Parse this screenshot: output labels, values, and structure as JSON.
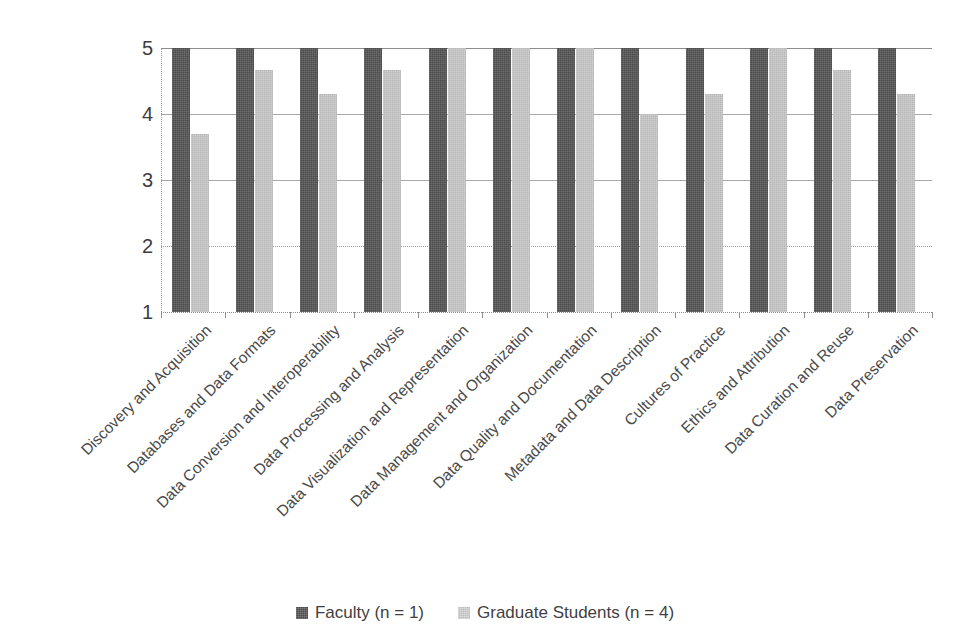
{
  "chart_data": {
    "type": "bar",
    "title": "",
    "subtitle": "",
    "xlabel": "",
    "ylabel": "",
    "ylim": [
      1,
      5
    ],
    "yticks": [
      "1",
      "2",
      "3",
      "4",
      "5"
    ],
    "grid": true,
    "legend_position": "bottom",
    "categories": [
      "Discovery and Acquisition",
      "Databases and Data Formats",
      "Data Conversion and Interoperability",
      "Data Processing and Analysis",
      "Data Visualization and Representation",
      "Data Management and Organization",
      "Data Quality and Documentation",
      "Metadata and Data Description",
      "Cultures of Practice",
      "Ethics and Attribution",
      "Data Curation and Reuse",
      "Data Preservation"
    ],
    "series": [
      {
        "name": "Faculty (n = 1)",
        "color": "#4a4a4a",
        "values": [
          5,
          5,
          5,
          5,
          5,
          5,
          5,
          5,
          5,
          5,
          5,
          5
        ]
      },
      {
        "name": "Graduate Students (n = 4)",
        "color": "#b7b7b7",
        "values": [
          3.7,
          4.67,
          4.3,
          4.67,
          5,
          5,
          5,
          4,
          4.3,
          5,
          4.67,
          4.3
        ]
      }
    ]
  },
  "legend": {
    "items": [
      {
        "label": "Faculty (n = 1)",
        "swatch": "faculty"
      },
      {
        "label": "Graduate Students (n = 4)",
        "swatch": "grad"
      }
    ]
  },
  "colors": {
    "faculty": "#4a4a4a",
    "graduate": "#b7b7b7",
    "gridline": "#a9a9a9",
    "text": "#3f3f3f"
  }
}
